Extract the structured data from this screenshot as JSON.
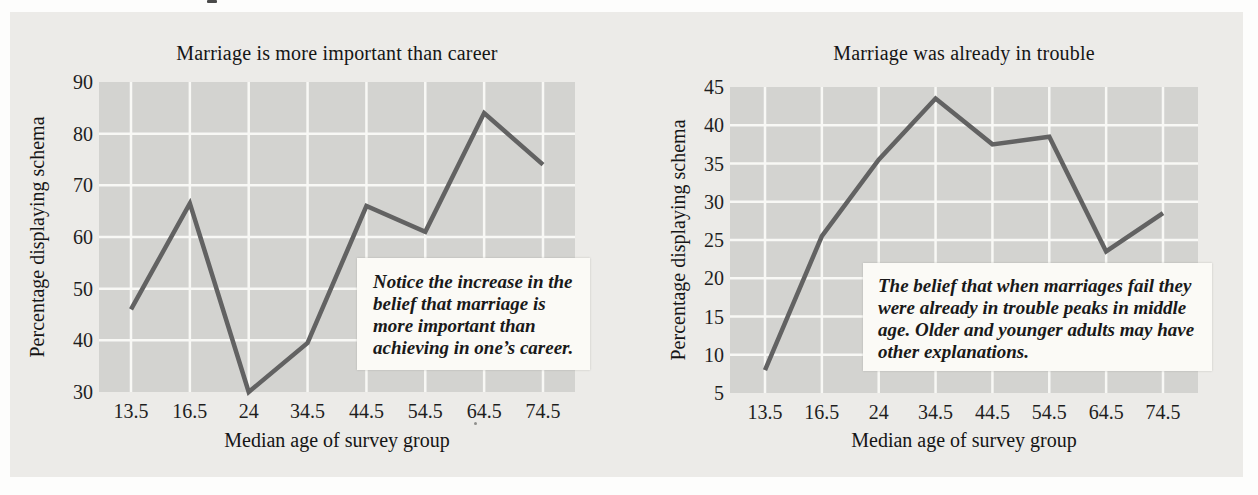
{
  "figure": {
    "panel_color": "#ecebe8",
    "plot_background": "#d3d3d0",
    "gridline_color": "#f8f8f5",
    "line_color": "#626262",
    "annotation_background": "#fbfaf6"
  },
  "chart_data": [
    {
      "type": "line",
      "title": "Marriage is more important than career",
      "xlabel": "Median age of survey group",
      "ylabel": "Percentage displaying schema",
      "categories": [
        "13.5",
        "16.5",
        "24",
        "34.5",
        "44.5",
        "54.5",
        "64.5",
        "74.5"
      ],
      "values": [
        46,
        66.5,
        30,
        39.5,
        66,
        61,
        84,
        74
      ],
      "yticks": [
        30,
        40,
        50,
        60,
        70,
        80,
        90
      ],
      "ylim": [
        30,
        90
      ],
      "grid": true,
      "legend": false,
      "annotation_lines": [
        "Notice the increase in the",
        "belief that marriage is",
        "more important than",
        "achieving in one’s career."
      ]
    },
    {
      "type": "line",
      "title": "Marriage was already in trouble",
      "xlabel": "Median age of survey group",
      "ylabel": "Percentage displaying schema",
      "categories": [
        "13.5",
        "16.5",
        "24",
        "34.5",
        "44.5",
        "54.5",
        "64.5",
        "74.5"
      ],
      "values": [
        8,
        25.5,
        35.5,
        43.5,
        37.5,
        38.5,
        23.5,
        28.5
      ],
      "yticks": [
        5,
        10,
        15,
        20,
        25,
        30,
        35,
        40,
        45
      ],
      "ylim": [
        5,
        45
      ],
      "grid": true,
      "legend": false,
      "annotation_lines": [
        "The belief that when marriages fail they",
        "were already in trouble peaks in middle",
        "age. Older and younger adults may have",
        "other explanations."
      ]
    }
  ]
}
